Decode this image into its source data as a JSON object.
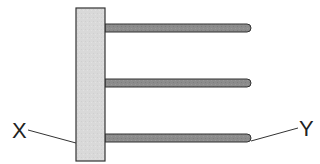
{
  "diagram": {
    "labels": {
      "x": "X",
      "y": "Y"
    },
    "colors": {
      "bar_fill": "#d8d8d8",
      "rod_fill": "#8a8a8a",
      "outline": "#333333",
      "leader_line": "#333333"
    },
    "rod_count": 3
  }
}
